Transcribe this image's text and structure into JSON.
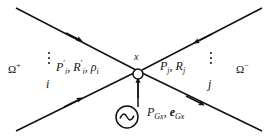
{
  "figure": {
    "type": "power-system-one-line-node-diagram",
    "background_color": "#ffffff",
    "line_color": "#111111",
    "width": 277,
    "height": 137
  },
  "regions": {
    "left": {
      "name": "omega-plus",
      "symbol": "Ω",
      "superscript": "+"
    },
    "right": {
      "name": "omega-minus",
      "symbol": "Ω",
      "superscript": "−"
    }
  },
  "node": {
    "label": "x",
    "marker": "open-circle"
  },
  "branches": {
    "left": {
      "index_label": "i",
      "quantities": "P′i, R′i, ρi",
      "ellipsis": "⋮"
    },
    "right": {
      "index_label": "j",
      "quantities": "Pj, Rj",
      "ellipsis": "⋮"
    }
  },
  "source": {
    "symbol_name": "ac-source-icon",
    "glyph": "∿",
    "quantities": "PGx, eGx"
  },
  "arrows": [
    {
      "name": "arrow-upper-left-inbound",
      "direction": "down-right",
      "description": "flow from upper-left toward node"
    },
    {
      "name": "arrow-upper-right-inbound",
      "direction": "down-left",
      "description": "flow from upper-right toward node"
    },
    {
      "name": "arrow-lower-left-inbound",
      "direction": "up-right",
      "description": "flow from lower-left toward node"
    },
    {
      "name": "arrow-lower-right-outbound",
      "direction": "down-right",
      "description": "flow from node toward lower-right"
    },
    {
      "name": "arrow-source-inbound",
      "direction": "up",
      "description": "injection from generator into node"
    }
  ]
}
